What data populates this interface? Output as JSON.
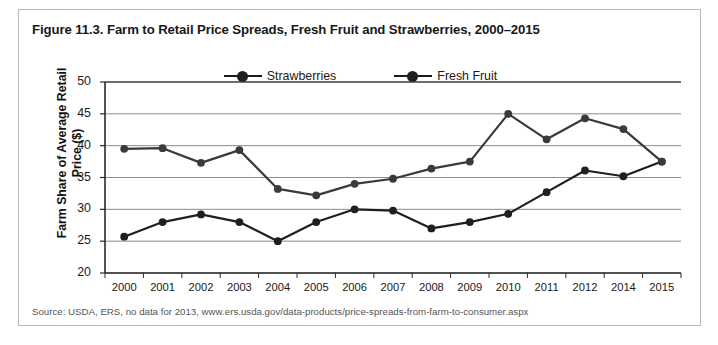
{
  "figure": {
    "title": "Figure 11.3. Farm to Retail Price Spreads, Fresh Fruit and Strawberries, 2000–2015",
    "source": "Source: USDA, ERS, no data for 2013, www.ers.usda.gov/data-products/price-spreads-from-farm-to-consumer.aspx"
  },
  "chart_data": {
    "type": "line",
    "title": "Figure 11.3. Farm to Retail Price Spreads, Fresh Fruit and Strawberries, 2000–2015",
    "xlabel": "",
    "ylabel": "Farm Share of Average Retail Price ($)",
    "categories": [
      "2000",
      "2001",
      "2002",
      "2003",
      "2004",
      "2005",
      "2006",
      "2007",
      "2008",
      "2009",
      "2010",
      "2011",
      "2012",
      "2014",
      "2015"
    ],
    "series": [
      {
        "name": "Strawberries",
        "values": [
          25.7,
          28.0,
          29.2,
          28.0,
          25.0,
          28.0,
          30.0,
          29.8,
          27.0,
          28.0,
          29.3,
          32.7,
          36.1,
          35.2,
          37.5
        ],
        "color": "#1f1f1f"
      },
      {
        "name": "Fresh Fruit",
        "values": [
          39.5,
          39.6,
          37.3,
          39.3,
          33.2,
          32.2,
          34.0,
          34.8,
          36.4,
          37.5,
          45.0,
          41.0,
          44.3,
          42.6,
          37.5
        ],
        "color": "#3a3a3a"
      }
    ],
    "ylim": [
      20,
      50
    ],
    "yticks": [
      20,
      25,
      30,
      35,
      40,
      45,
      50
    ],
    "ytick_labels": [
      "20",
      "25",
      "30",
      "35",
      "40",
      "45",
      "50"
    ],
    "grid": true,
    "legend_position": "top-center",
    "note": "no data for 2013"
  }
}
